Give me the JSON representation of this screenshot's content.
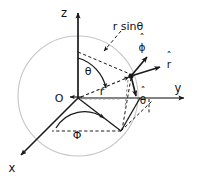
{
  "figure": {
    "type": "3d-coordinate-diagram",
    "background_color": "#ffffff",
    "stroke_color": "#1a1a1a",
    "sphere_color": "#c8c8c8"
  },
  "labels": {
    "origin": "O",
    "axis_z": "z",
    "axis_y": "y",
    "axis_x": "x",
    "angle_theta": "θ",
    "angle_phi": "Φ",
    "radius": "r",
    "r_sin_theta": "r sinθ",
    "unit_phi": "ϕ",
    "unit_r": "r",
    "unit_theta": "θ",
    "hat_mark": "ˆ"
  },
  "geometry": {
    "origin": {
      "x": 78,
      "y": 98
    },
    "point_p": {
      "x": 131,
      "y": 76
    },
    "sphere": {
      "cx": 78,
      "cy": 96,
      "r": 60
    },
    "axis_z_tip": {
      "x": 78,
      "y": 11
    },
    "axis_y_tip": {
      "x": 186,
      "y": 98
    },
    "axis_x_tip": {
      "x": 19,
      "y": 157
    },
    "projection_xy": {
      "x": 121,
      "y": 131
    },
    "foot_y": {
      "x": 149,
      "y": 98
    },
    "foot_x_dash": {
      "x": 53,
      "y": 131
    }
  },
  "vectors": [
    {
      "name": "r-hat",
      "label": "r",
      "from": {
        "x": 131,
        "y": 76
      },
      "to": {
        "x": 163,
        "y": 66
      }
    },
    {
      "name": "phi-hat",
      "label": "ϕ",
      "from": {
        "x": 131,
        "y": 76
      },
      "to": {
        "x": 149,
        "y": 55
      }
    },
    {
      "name": "theta-hat",
      "label": "θ",
      "from": {
        "x": 131,
        "y": 76
      },
      "to": {
        "x": 137,
        "y": 99
      }
    }
  ],
  "label_positions": {
    "origin": {
      "x": 59,
      "y": 101
    },
    "axis_z": {
      "x": 64,
      "y": 13
    },
    "axis_y": {
      "x": 178,
      "y": 90
    },
    "axis_x": {
      "x": 10,
      "y": 170
    },
    "angle_theta": {
      "x": 87,
      "y": 72
    },
    "angle_phi": {
      "x": 76,
      "y": 134
    },
    "radius": {
      "x": 101,
      "y": 92
    },
    "r_sin_theta": {
      "x": 109,
      "y": 27
    },
    "unit_phi": {
      "x": 142,
      "y": 46
    },
    "unit_r": {
      "x": 168,
      "y": 65
    },
    "unit_theta": {
      "x": 141,
      "y": 101
    }
  }
}
